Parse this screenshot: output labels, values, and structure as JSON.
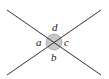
{
  "diagram": {
    "type": "intersecting-lines-angles",
    "labels": {
      "top": "d",
      "left": "a",
      "right": "c",
      "bottom": "b"
    },
    "colors": {
      "line": "#333333",
      "circle_fill": "#c8c8c8",
      "circle_stroke": "#888888"
    }
  }
}
